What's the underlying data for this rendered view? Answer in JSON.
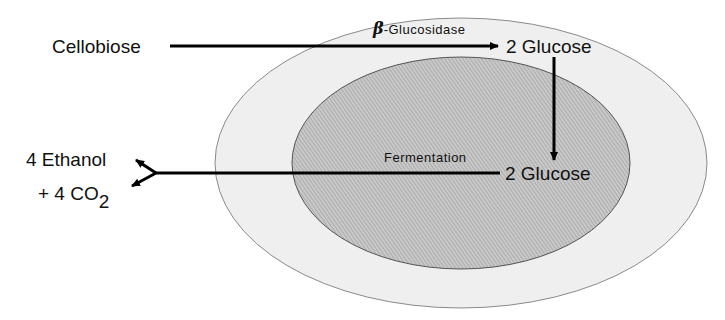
{
  "diagram": {
    "outer_region": {
      "fill": "#efefef",
      "stroke": "#888888"
    },
    "inner_region": {
      "fill": "#bdbdbd",
      "stroke": "#555555",
      "label": "Fermentation"
    },
    "substrate": "Cellobiose",
    "enzyme": {
      "symbol": "β",
      "name": "-Glucosidase"
    },
    "product_outer": "2 Glucose",
    "product_inner": "2 Glucose",
    "end_products": {
      "ethanol": "4 Ethanol",
      "co2_prefix": "+ 4 CO",
      "co2_subscript": "2"
    }
  }
}
